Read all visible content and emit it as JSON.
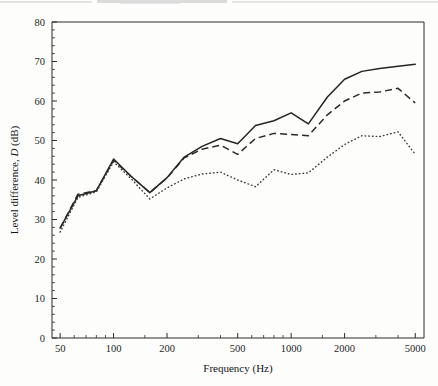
{
  "figure": {
    "background_color": "#fdfdfc",
    "frame_color": "#2b2b2b",
    "is_scanned_page": true
  },
  "chart_data": {
    "type": "line",
    "title": "",
    "xlabel": "Frequency (Hz)",
    "ylabel_prefix": "Level difference, ",
    "ylabel_symbol": "D",
    "ylabel_suffix": " (dB)",
    "xlabel_full": "Frequency (Hz)",
    "ylabel_full": "Level difference, D (dB)",
    "xscale": "log",
    "yscale": "linear",
    "xlim": [
      45,
      5600
    ],
    "ylim": [
      0,
      80
    ],
    "grid": false,
    "legend": "none",
    "x_tick_labels": [
      "50",
      "100",
      "200",
      "500",
      "1000",
      "2000",
      "5000"
    ],
    "x_tick_values": [
      50,
      100,
      200,
      500,
      1000,
      2000,
      5000
    ],
    "x_minor_ticks": [
      60,
      70,
      80,
      90,
      150,
      300,
      400,
      600,
      700,
      800,
      900,
      1500,
      3000,
      4000
    ],
    "y_tick_labels": [
      "0",
      "10",
      "20",
      "30",
      "40",
      "50",
      "60",
      "70",
      "80"
    ],
    "y_tick_values": [
      0,
      10,
      20,
      30,
      40,
      50,
      60,
      70,
      80
    ],
    "y_minor_tick_step": 2,
    "x": [
      50,
      63,
      80,
      100,
      125,
      160,
      200,
      250,
      315,
      400,
      500,
      630,
      800,
      1000,
      1250,
      1600,
      2000,
      2500,
      3150,
      4000,
      5000
    ],
    "series": [
      {
        "name": "solid",
        "line_style": "solid",
        "color": "#242424",
        "values": [
          27.8,
          36.0,
          37.3,
          45.3,
          41.0,
          36.8,
          40.6,
          45.8,
          48.5,
          50.5,
          49.2,
          53.8,
          55.0,
          57.0,
          54.2,
          61.0,
          65.5,
          67.5,
          68.2,
          68.8,
          69.3
        ]
      },
      {
        "name": "dashed",
        "line_style": "dashed",
        "color": "#2a2a2a",
        "values": [
          27.8,
          36.4,
          37.3,
          45.0,
          41.0,
          36.8,
          40.5,
          45.6,
          47.8,
          48.8,
          46.5,
          50.5,
          51.8,
          51.5,
          51.2,
          56.5,
          60.0,
          62.0,
          62.3,
          63.2,
          59.5
        ]
      },
      {
        "name": "dotted",
        "line_style": "dotted",
        "color": "#3a3a3a",
        "values": [
          26.8,
          35.6,
          37.0,
          44.6,
          40.4,
          35.2,
          38.0,
          40.3,
          41.5,
          42.0,
          40.0,
          38.3,
          42.6,
          41.4,
          41.8,
          45.8,
          49.0,
          51.2,
          51.0,
          52.2,
          46.5
        ]
      }
    ]
  }
}
